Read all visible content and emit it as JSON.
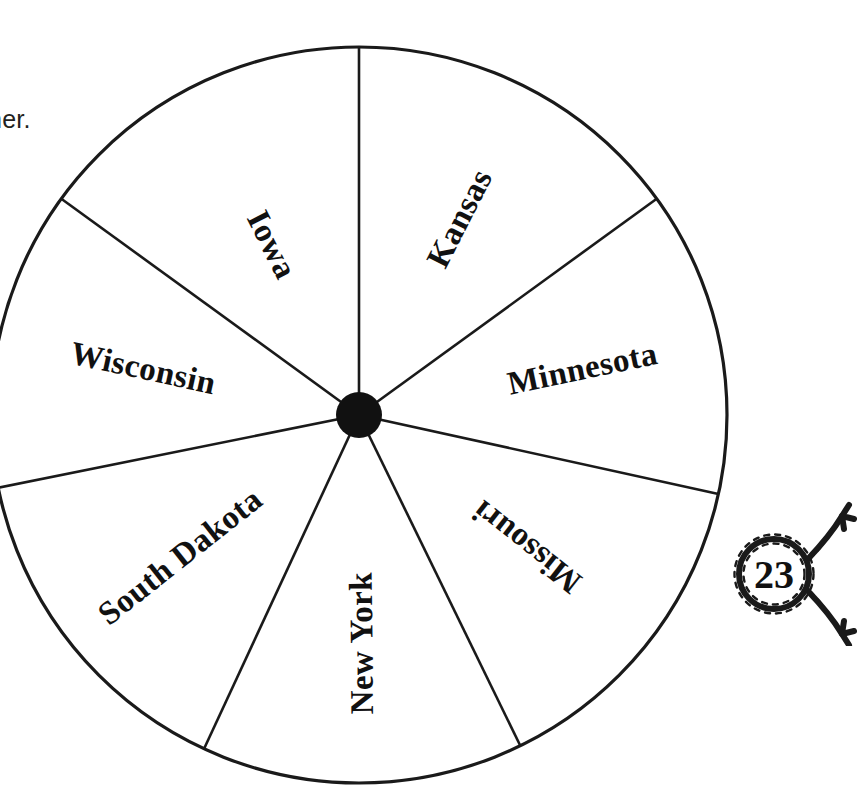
{
  "worksheet": {
    "instruction_text": "nner.",
    "page_badge": {
      "number": "23",
      "icon": "rope-lasso-badge"
    }
  },
  "spinner": {
    "name": "state-name-spinner",
    "center_x": 359,
    "center_y": 415,
    "radius": 368,
    "hub_radius": 23,
    "outline_color": "#1a1a1a",
    "fill_color": "#ffffff",
    "hub_color": "#111111",
    "sector_count": 7,
    "sectors": [
      {
        "label": "Kansas",
        "start_deg": 36.0,
        "end_deg": 90.0,
        "mid_deg": 63.0,
        "flip": false,
        "label_radius": 0.6
      },
      {
        "label": "Iowa",
        "start_deg": 90.0,
        "end_deg": 144.0,
        "mid_deg": 117.0,
        "flip": true,
        "label_radius": 0.52
      },
      {
        "label": "Wisconsin",
        "start_deg": 144.0,
        "end_deg": 191.4,
        "mid_deg": 167.7,
        "flip": true,
        "label_radius": 0.6
      },
      {
        "label": "South Dakota",
        "start_deg": 191.4,
        "end_deg": 245.1,
        "mid_deg": 218.3,
        "flip": true,
        "label_radius": 0.62
      },
      {
        "label": "New York",
        "start_deg": 245.1,
        "end_deg": 296.0,
        "mid_deg": 270.6,
        "flip": true,
        "label_radius": 0.62
      },
      {
        "label": "Missouri",
        "start_deg": 296.0,
        "end_deg": 347.6,
        "mid_deg": 321.8,
        "flip": true,
        "label_radius": 0.58
      },
      {
        "label": "Minnesota",
        "start_deg": 347.6,
        "end_deg": 36.0,
        "mid_deg": 11.8,
        "flip": false,
        "label_radius": 0.62
      }
    ]
  }
}
